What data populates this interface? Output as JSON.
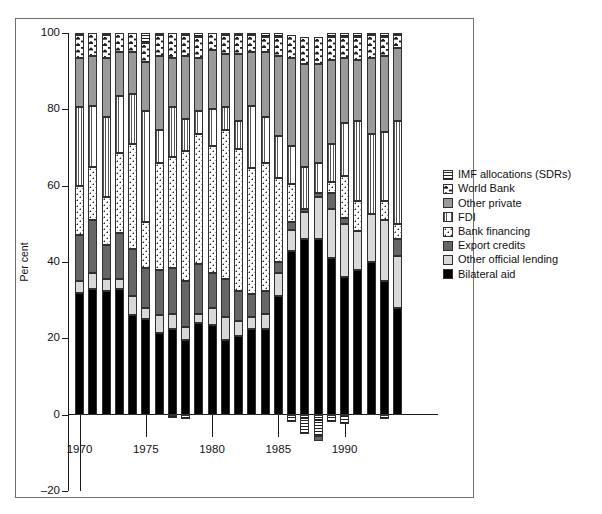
{
  "chart_data": {
    "type": "bar",
    "subtype": "stacked-bar",
    "title": "",
    "xlabel": "",
    "ylabel": "Per cent",
    "ylim": [
      -20,
      100
    ],
    "yticks": [
      -20,
      0,
      20,
      40,
      60,
      80,
      100
    ],
    "ytick_labels": [
      "–20",
      "0",
      "20",
      "40",
      "60",
      "80",
      "100"
    ],
    "xticks": [
      1970,
      1975,
      1980,
      1985,
      1990
    ],
    "xtick_labels": [
      "1970",
      "1975",
      "1980",
      "1985",
      "1990"
    ],
    "grid": false,
    "legend_position": "right",
    "categories": [
      1970,
      1971,
      1972,
      1973,
      1974,
      1975,
      1976,
      1977,
      1978,
      1979,
      1980,
      1981,
      1982,
      1983,
      1984,
      1985,
      1986,
      1987,
      1988,
      1989,
      1990,
      1991,
      1992,
      1993,
      1994
    ],
    "series": [
      {
        "name": "Bilateral aid",
        "key": "bilateral",
        "pattern": "solid-black",
        "color": "#000000",
        "values": [
          32.0,
          33.0,
          32.5,
          33.0,
          26.0,
          25.0,
          21.5,
          22.5,
          19.5,
          24.0,
          23.5,
          19.5,
          20.5,
          22.5,
          22.5,
          31.0,
          43.0,
          46.0,
          46.0,
          41.0,
          36.0,
          38.0,
          40.0,
          35.0,
          28.0
        ]
      },
      {
        "name": "Other official lending",
        "key": "other_official",
        "pattern": "solid-light-grey",
        "color": "#d8d8d8",
        "values": [
          3.0,
          4.0,
          3.0,
          2.5,
          5.0,
          3.0,
          4.5,
          4.0,
          3.5,
          2.5,
          4.5,
          6.0,
          4.0,
          3.0,
          4.0,
          6.0,
          5.5,
          7.0,
          11.0,
          13.0,
          14.0,
          10.0,
          12.5,
          16.0,
          13.5
        ]
      },
      {
        "name": "Export credits",
        "key": "export_credits",
        "pattern": "solid-dark-grey",
        "color": "#666666",
        "values": [
          12.0,
          14.0,
          9.0,
          12.0,
          12.5,
          10.5,
          12.0,
          12.0,
          12.0,
          13.0,
          9.0,
          10.0,
          8.0,
          6.0,
          6.0,
          3.0,
          2.0,
          1.0,
          1.0,
          4.0,
          1.5,
          0.0,
          0.0,
          0.0,
          4.5
        ]
      },
      {
        "name": "Bank financing",
        "key": "bank_financing",
        "pattern": "dotted",
        "color": "#ffffff",
        "values": [
          13.0,
          14.0,
          12.5,
          21.0,
          27.5,
          12.0,
          28.0,
          29.0,
          34.0,
          34.0,
          33.5,
          39.0,
          37.0,
          33.0,
          33.5,
          22.0,
          10.0,
          0.0,
          0.0,
          3.0,
          11.0,
          8.0,
          0.0,
          5.0,
          4.0
        ]
      },
      {
        "name": "FDI",
        "key": "fdi",
        "pattern": "vertical-lines",
        "color": "#ffffff",
        "values": [
          20.5,
          16.0,
          21.0,
          15.0,
          13.0,
          29.0,
          8.5,
          13.0,
          8.5,
          6.0,
          9.5,
          6.0,
          7.5,
          16.5,
          12.0,
          11.0,
          10.0,
          11.0,
          8.0,
          10.0,
          14.0,
          21.0,
          21.0,
          18.0,
          27.0
        ]
      },
      {
        "name": "Other private",
        "key": "other_private",
        "pattern": "solid-mid-grey",
        "color": "#9a9a9a",
        "values": [
          13.0,
          13.0,
          15.5,
          11.5,
          11.0,
          13.0,
          19.5,
          13.0,
          16.5,
          14.0,
          15.5,
          14.0,
          17.5,
          14.0,
          17.0,
          21.0,
          23.0,
          27.0,
          26.0,
          22.0,
          17.0,
          16.0,
          20.0,
          20.0,
          19.0
        ]
      },
      {
        "name": "World Bank",
        "key": "world_bank",
        "pattern": "world-bank-marks",
        "color": "#ffffff",
        "values": [
          6.0,
          6.0,
          6.0,
          5.0,
          5.0,
          5.0,
          5.5,
          6.5,
          5.5,
          5.5,
          4.5,
          5.0,
          5.0,
          4.5,
          4.0,
          5.0,
          6.0,
          7.0,
          7.0,
          6.0,
          5.5,
          6.0,
          6.0,
          5.0,
          3.5
        ]
      },
      {
        "name": "IMF allocations (SDRs)",
        "key": "imf",
        "pattern": "horizontal-lines",
        "color": "#ffffff",
        "values": [
          0.5,
          0.0,
          0.5,
          0.0,
          0.0,
          2.5,
          0.5,
          0.0,
          0.5,
          1.0,
          0.0,
          0.5,
          0.5,
          0.5,
          1.0,
          1.0,
          0.0,
          0.0,
          0.0,
          1.0,
          1.0,
          1.0,
          0.5,
          1.0,
          0.5
        ]
      },
      {
        "name": "IMF allocations (SDRs) negative",
        "key": "imf_negative",
        "pattern": "horizontal-lines",
        "color": "#ffffff",
        "values": [
          0,
          0,
          0,
          0,
          0,
          0,
          0,
          -0.8,
          -1.2,
          0,
          0,
          0,
          0,
          0,
          0,
          0,
          -2.0,
          -5.0,
          -5.5,
          -2.0,
          -2.5,
          0,
          0,
          -1.2,
          0
        ]
      },
      {
        "name": "Export credits negative",
        "key": "export_negative",
        "pattern": "solid-dark-grey",
        "color": "#666666",
        "values": [
          0,
          0,
          0,
          0,
          0,
          0,
          0,
          0,
          0,
          0,
          0,
          0,
          0,
          0,
          0,
          0,
          0,
          0,
          -1.5,
          0,
          0,
          0,
          0,
          0,
          0
        ]
      }
    ]
  },
  "legend": {
    "items": [
      {
        "label": "IMF allocations (SDRs)",
        "swatch": "horizontal-lines"
      },
      {
        "label": "World Bank",
        "swatch": "world-bank-marks"
      },
      {
        "label": "Other private",
        "swatch": "solid-mid-grey"
      },
      {
        "label": "FDI",
        "swatch": "vertical-lines"
      },
      {
        "label": "Bank financing",
        "swatch": "dotted"
      },
      {
        "label": "Export credits",
        "swatch": "solid-dark-grey"
      },
      {
        "label": "Other official lending",
        "swatch": "solid-light-grey"
      },
      {
        "label": "Bilateral aid",
        "swatch": "solid-black"
      }
    ]
  },
  "axes": {
    "y_title": "Per cent"
  }
}
